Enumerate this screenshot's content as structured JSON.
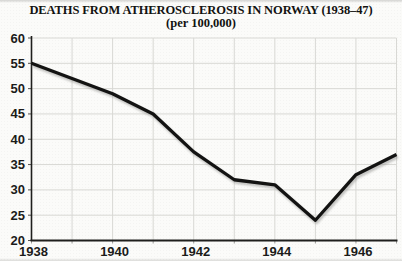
{
  "chart_data": {
    "type": "line",
    "title": "DEATHS FROM ATHEROSCLEROSIS IN NORWAY (1938–47)",
    "subtitle": "(per 100,000)",
    "x": [
      1938,
      1939,
      1940,
      1941,
      1942,
      1943,
      1944,
      1945,
      1946,
      1947
    ],
    "series": [
      {
        "name": "deaths_per_100000",
        "values": [
          55,
          52,
          49,
          45,
          37.5,
          32,
          31,
          24,
          33,
          37
        ]
      }
    ],
    "xlabel": "",
    "ylabel": "",
    "xlim": [
      1938,
      1947
    ],
    "ylim": [
      20,
      60
    ],
    "y_ticks": [
      20,
      25,
      30,
      35,
      40,
      45,
      50,
      55,
      60
    ],
    "x_ticks": [
      1938,
      1940,
      1942,
      1944,
      1946
    ],
    "grid": true,
    "legend": "none",
    "colors": {
      "line": "#131312",
      "line_shadow": "#8f8f8c",
      "grid": "#d8d8d4",
      "axis": "#1f1f1d",
      "tick_text": "#1b1b19",
      "background": "#fbfbf9"
    }
  }
}
